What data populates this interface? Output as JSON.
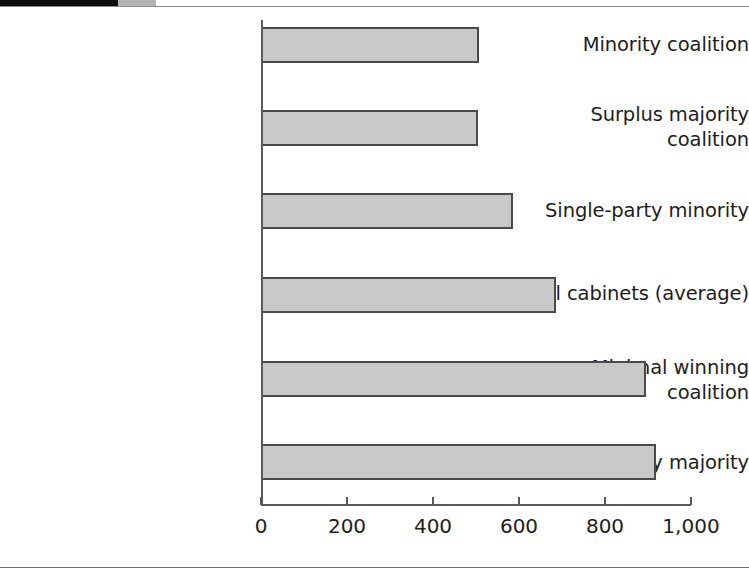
{
  "chart_data": {
    "type": "bar",
    "orientation": "horizontal",
    "title": "",
    "subtitle": "",
    "xlabel": "",
    "ylabel": "",
    "xlim": [
      0,
      1000
    ],
    "grid": false,
    "legend": null,
    "tick_labels": [
      "0",
      "200",
      "400",
      "600",
      "800",
      "1,000"
    ],
    "tick_values": [
      0,
      200,
      400,
      600,
      800,
      1000
    ],
    "categories": [
      "Minority coalition",
      "Surplus majority\ncoalition",
      "Single-party minority",
      "All cabinets (average)",
      "Minimal winning\ncoalition",
      "Single-party majority"
    ],
    "values": [
      507,
      505,
      586,
      687,
      895,
      918
    ],
    "bar_fill_color": "#c9c9c9",
    "bar_border_color": "#4a4a4a",
    "axis_color": "#5a5a5a"
  }
}
